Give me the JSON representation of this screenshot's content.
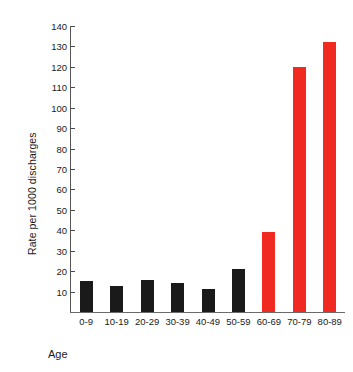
{
  "chart_data": {
    "type": "bar",
    "title": "",
    "subtitle": "",
    "xlabel": "Age",
    "ylabel": "Rate per 1000 discharges",
    "categories": [
      "0-9",
      "10-19",
      "20-29",
      "30-39",
      "40-49",
      "50-59",
      "60-69",
      "70-79",
      "80-89"
    ],
    "values": [
      15,
      12.5,
      15.5,
      14,
      11.5,
      21,
      39,
      120,
      132
    ],
    "bar_colors": [
      "#1a1a1a",
      "#1a1a1a",
      "#1a1a1a",
      "#1a1a1a",
      "#1a1a1a",
      "#1a1a1a",
      "#f02a20",
      "#f02a20",
      "#f02a20"
    ],
    "ylim": [
      0,
      140
    ],
    "yticks": [
      10,
      20,
      30,
      40,
      50,
      60,
      70,
      80,
      90,
      100,
      110,
      120,
      130,
      140
    ],
    "ytick_labels": [
      "10",
      "20",
      "30",
      "40",
      "50",
      "60",
      "70",
      "80",
      "90",
      "100",
      "110",
      "120",
      "130",
      "140"
    ],
    "grid": false,
    "legend": null,
    "legend_position": "none",
    "annotations": []
  },
  "axes": {
    "y_title": "Rate per 1000 discharges",
    "x_title": "Age"
  },
  "colors": {
    "bar_black": "#1a1a1a",
    "bar_red": "#f02a20",
    "axis": "#555555",
    "background": "#ffffff"
  }
}
